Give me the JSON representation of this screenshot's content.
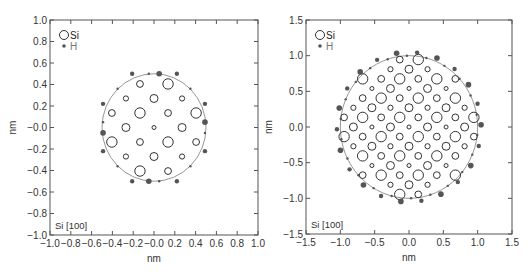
{
  "chart_data": [
    {
      "type": "scatter",
      "title": "",
      "xlabel": "nm",
      "ylabel": "nm",
      "xlim": [
        -1.0,
        1.0
      ],
      "ylim": [
        -1.0,
        1.0
      ],
      "xticks": [
        "−1.0",
        "−0.8",
        "−0.6",
        "−0.4",
        "−0.2",
        "−0.0",
        "0.2",
        "0.4",
        "0.6",
        "0.8",
        "1.0"
      ],
      "yticks": [
        "1.0",
        "0.8",
        "0.6",
        "0.4",
        "0.2",
        "−0.0",
        "−0.2",
        "−0.4",
        "−0.6",
        "−0.8",
        "−1.0"
      ],
      "grid": false,
      "legend": [
        {
          "label": "Si",
          "marker": "open-circle"
        },
        {
          "label": "H",
          "marker": "filled-dot"
        }
      ],
      "legend_position": "upper-left",
      "annotation": "Si [100]",
      "boundary_circle_radius_nm": 0.5,
      "lattice_step_nm": 0.135,
      "si_atoms": [
        {
          "x": -0.135,
          "y": 0.405,
          "size": "small-med"
        },
        {
          "x": 0.135,
          "y": 0.405,
          "size": "large"
        },
        {
          "x": -0.27,
          "y": 0.27,
          "size": "small"
        },
        {
          "x": 0.0,
          "y": 0.27,
          "size": "medium"
        },
        {
          "x": 0.27,
          "y": 0.27,
          "size": "small"
        },
        {
          "x": -0.405,
          "y": 0.135,
          "size": "small-med"
        },
        {
          "x": -0.135,
          "y": 0.135,
          "size": "large"
        },
        {
          "x": 0.135,
          "y": 0.135,
          "size": "small-med"
        },
        {
          "x": 0.405,
          "y": 0.135,
          "size": "large"
        },
        {
          "x": -0.27,
          "y": 0.0,
          "size": "medium"
        },
        {
          "x": 0.0,
          "y": 0.0,
          "size": "tiny"
        },
        {
          "x": 0.27,
          "y": 0.0,
          "size": "medium"
        },
        {
          "x": -0.405,
          "y": -0.135,
          "size": "large"
        },
        {
          "x": -0.135,
          "y": -0.135,
          "size": "small-med"
        },
        {
          "x": 0.135,
          "y": -0.135,
          "size": "large"
        },
        {
          "x": 0.405,
          "y": -0.135,
          "size": "small-med"
        },
        {
          "x": -0.27,
          "y": -0.27,
          "size": "small"
        },
        {
          "x": 0.0,
          "y": -0.27,
          "size": "medium"
        },
        {
          "x": 0.27,
          "y": -0.27,
          "size": "small"
        },
        {
          "x": -0.135,
          "y": -0.405,
          "size": "large"
        },
        {
          "x": 0.135,
          "y": -0.405,
          "size": "small-med"
        }
      ],
      "h_atoms": [
        {
          "x": 0.05,
          "y": 0.5,
          "size": "large"
        },
        {
          "x": -0.05,
          "y": -0.5,
          "size": "large"
        },
        {
          "x": -0.49,
          "y": -0.05,
          "size": "large"
        },
        {
          "x": 0.49,
          "y": 0.05,
          "size": "large"
        },
        {
          "x": -0.21,
          "y": 0.5,
          "size": "medium"
        },
        {
          "x": 0.22,
          "y": 0.5,
          "size": "medium"
        },
        {
          "x": -0.21,
          "y": -0.5,
          "size": "medium"
        },
        {
          "x": 0.22,
          "y": -0.5,
          "size": "medium"
        },
        {
          "x": -0.49,
          "y": 0.22,
          "size": "medium"
        },
        {
          "x": -0.49,
          "y": -0.22,
          "size": "medium"
        },
        {
          "x": 0.49,
          "y": 0.22,
          "size": "medium"
        },
        {
          "x": 0.49,
          "y": -0.22,
          "size": "medium"
        },
        {
          "x": -0.05,
          "y": 0.5,
          "size": "small"
        },
        {
          "x": 0.05,
          "y": -0.5,
          "size": "small"
        },
        {
          "x": -0.35,
          "y": 0.36,
          "size": "small"
        },
        {
          "x": 0.35,
          "y": 0.36,
          "size": "small"
        },
        {
          "x": -0.35,
          "y": -0.36,
          "size": "small"
        },
        {
          "x": 0.35,
          "y": -0.36,
          "size": "small"
        },
        {
          "x": -0.49,
          "y": 0.05,
          "size": "small"
        },
        {
          "x": 0.49,
          "y": -0.05,
          "size": "small"
        }
      ]
    },
    {
      "type": "scatter",
      "title": "",
      "xlabel": "nm",
      "ylabel": "nm",
      "xlim": [
        -1.5,
        1.5
      ],
      "ylim": [
        -1.5,
        1.5
      ],
      "xticks": [
        "−1.5",
        "−1.0",
        "−0.5",
        "0.0",
        "0.5",
        "1.0",
        "1.5"
      ],
      "yticks": [
        "1.5",
        "1.0",
        "0.5",
        "0.0",
        "−0.5",
        "−1.0",
        "−1.5"
      ],
      "grid": false,
      "legend": [
        {
          "label": "Si",
          "marker": "open-circle"
        },
        {
          "label": "H",
          "marker": "filled-dot"
        }
      ],
      "legend_position": "upper-left",
      "annotation": "Si [100]",
      "boundary_circle_radius_nm": 1.0,
      "lattice_step_nm": 0.135,
      "si_atoms_rule": "Si positions at (i,j)*0.135 nm with i+j even inside radius; size classes repeat with period 4 as in left panel",
      "h_atoms_note": "H atoms (filled dots) decorate the sphere surface at r≈1.0–1.08 nm"
    }
  ],
  "sizes": {
    "si_radius_px": {
      "large": 5.2,
      "medium": 4.0,
      "small-med": 3.4,
      "small": 2.6,
      "tiny": 2.0
    },
    "h_radius_px": {
      "large": 2.8,
      "medium": 2.2,
      "small": 1.2
    }
  },
  "colors": {
    "axis": "#555555",
    "si_stroke": "#333333",
    "h_fill": "#555555",
    "boundary": "#8a8a8a",
    "text": "#333333",
    "legend_h_text": "#777777"
  },
  "left_panel": {
    "legend_si": "Si",
    "legend_h": "H",
    "annotation": "Si [100]",
    "xlabel": "nm",
    "ylabel": "nm"
  },
  "right_panel": {
    "legend_si": "Si",
    "legend_h": "H",
    "annotation": "Si [100]",
    "xlabel": "nm",
    "ylabel": "nm"
  }
}
